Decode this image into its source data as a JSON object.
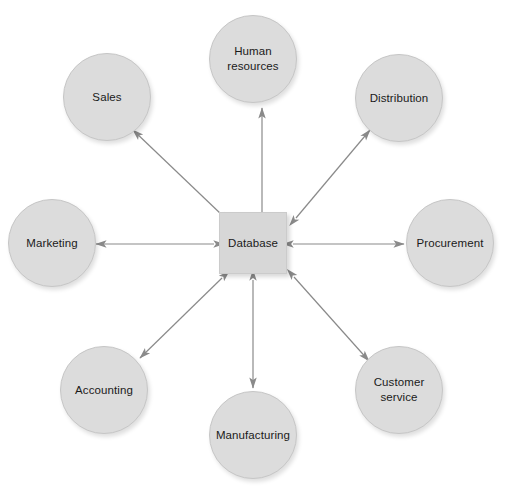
{
  "diagram": {
    "type": "hub-and-spoke",
    "background_color": "#ffffff",
    "node_fill_color": "#dcdcdc",
    "node_border_color": "#c6c6c6",
    "hub_fill_color": "#d7d7d7",
    "edge_color": "#8a8a8a",
    "text_color": "#1a1a1a",
    "hub": {
      "id": "database",
      "label": "Database",
      "shape": "rectangle",
      "x": 253,
      "y": 243,
      "width": 68,
      "height": 62
    },
    "nodes": [
      {
        "id": "human-resources",
        "label": "Human\nresources",
        "shape": "circle",
        "x": 253,
        "y": 59,
        "r": 44
      },
      {
        "id": "distribution",
        "label": "Distribution",
        "shape": "circle",
        "x": 399,
        "y": 98,
        "r": 44
      },
      {
        "id": "procurement",
        "label": "Procurement",
        "shape": "circle",
        "x": 450,
        "y": 243,
        "r": 44
      },
      {
        "id": "customer-service",
        "label": "Customer\nservice",
        "shape": "circle",
        "x": 399,
        "y": 390,
        "r": 44
      },
      {
        "id": "manufacturing",
        "label": "Manufacturing",
        "shape": "circle",
        "x": 253,
        "y": 435,
        "r": 44
      },
      {
        "id": "accounting",
        "label": "Accounting",
        "shape": "circle",
        "x": 104,
        "y": 390,
        "r": 44
      },
      {
        "id": "marketing",
        "label": "Marketing",
        "shape": "circle",
        "x": 52,
        "y": 243,
        "r": 44
      },
      {
        "id": "sales",
        "label": "Sales",
        "shape": "circle",
        "x": 107,
        "y": 97,
        "r": 44
      }
    ],
    "edges": [
      {
        "id": "edge-database-human-resources",
        "from": "database",
        "to": "human-resources",
        "arrow": "both",
        "x1": 262,
        "y1": 214,
        "x2": 262,
        "y2": 108
      },
      {
        "id": "edge-database-distribution",
        "from": "database",
        "to": "distribution",
        "arrow": "both",
        "x1": 296,
        "y1": 218,
        "x2": 370,
        "y2": 130
      },
      {
        "id": "edge-database-procurement",
        "from": "database",
        "to": "procurement",
        "arrow": "both",
        "x1": 293,
        "y1": 244,
        "x2": 404,
        "y2": 244
      },
      {
        "id": "edge-database-customer-service",
        "from": "database",
        "to": "customer-service",
        "arrow": "both",
        "x1": 294,
        "y1": 277,
        "x2": 369,
        "y2": 361
      },
      {
        "id": "edge-database-manufacturing",
        "from": "database",
        "to": "manufacturing",
        "arrow": "both",
        "x1": 253,
        "y1": 280,
        "x2": 253,
        "y2": 388
      },
      {
        "id": "edge-database-accounting",
        "from": "database",
        "to": "accounting",
        "arrow": "both",
        "x1": 222,
        "y1": 278,
        "x2": 140,
        "y2": 358
      },
      {
        "id": "edge-database-marketing",
        "from": "database",
        "to": "marketing",
        "arrow": "both",
        "x1": 214,
        "y1": 244,
        "x2": 96,
        "y2": 244
      },
      {
        "id": "edge-database-sales",
        "from": "database",
        "to": "sales",
        "arrow": "both",
        "x1": 222,
        "y1": 215,
        "x2": 133,
        "y2": 130
      }
    ]
  }
}
